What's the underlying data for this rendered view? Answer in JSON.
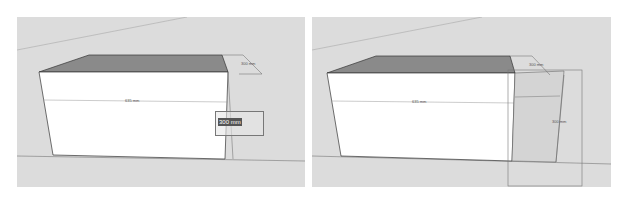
{
  "panels": [
    {
      "id": "left",
      "dimensions": {
        "depth_label": "300 mm",
        "width_label": "635 mm"
      },
      "input_box": {
        "value": "300 mm"
      }
    },
    {
      "id": "right",
      "dimensions": {
        "depth_label": "300 mm",
        "width_label": "635 mm",
        "height_label": "300 mm"
      }
    }
  ],
  "colors": {
    "background": "#dcdcdc",
    "front_face": "#ffffff",
    "top_face": "#8a8a8a",
    "edge": "#333333"
  }
}
